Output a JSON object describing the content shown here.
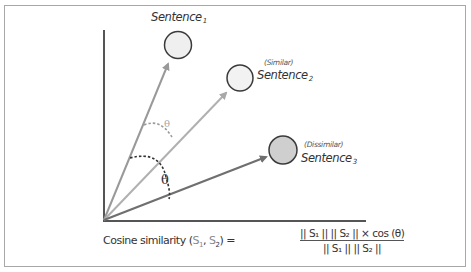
{
  "diagram": {
    "colors": {
      "frame": "#a8a8a8",
      "axis": "#555555",
      "vector_1": "#999999",
      "vector_2": "#b0b0b0",
      "vector_3": "#777777",
      "circle_stroke": "#3a3a3a",
      "circle_light_fill": "#efefef",
      "circle_dissimilar_fill": "#cfcfcf",
      "angle_arc_dark": "#333333",
      "angle_arc_light": "#9a9a9a"
    },
    "nodes": [
      {
        "id": "sentence1",
        "label": "Sentence",
        "subscript": "1",
        "tag": ""
      },
      {
        "id": "sentence2",
        "label": "Sentence",
        "subscript": "2",
        "tag": "(Similar)"
      },
      {
        "id": "sentence3",
        "label": "Sentence",
        "subscript": "3",
        "tag": "(Dissimilar)"
      }
    ],
    "angles": {
      "theta_between_1_and_2": "θ",
      "theta_between_2_and_3": "θ"
    }
  },
  "formula": {
    "lhs_prefix": "Cosine similarity (",
    "lhs_s1": "S",
    "lhs_s1_sub": "1",
    "lhs_sep": ", ",
    "lhs_s2": "S",
    "lhs_s2_sub": "2",
    "lhs_suffix": ") =",
    "numerator": "|| S₁ || || S₂ || × cos (θ)",
    "denominator": "|| S₁ || || S₂ ||"
  }
}
